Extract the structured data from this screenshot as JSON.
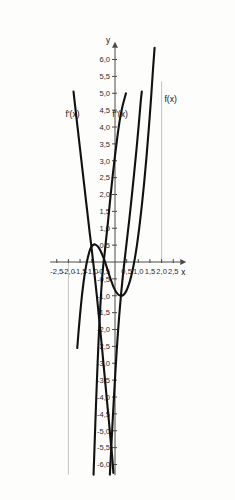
{
  "chart_data": {
    "type": "line",
    "title": "",
    "subtitle": "",
    "xlabel": "x",
    "ylabel": "y",
    "xlim": [
      -2.75,
      2.75
    ],
    "ylim": [
      -6.3,
      6.4
    ],
    "grid": true,
    "grid_description": "light gray vertical gridlines at x = -2,0 (below axis) and x = 2,0 (above axis)",
    "decimal_separator": ",",
    "legend_position": "inline curve labels",
    "x_ticks": [
      -2.5,
      -2.0,
      -1.5,
      -1.0,
      -0.5,
      0.5,
      1.0,
      1.5,
      2.0,
      2.5
    ],
    "x_tick_labels": [
      "-2,5",
      "-2,0",
      "-1,5",
      "-1,0",
      "-0,5",
      "0,5",
      "1,0",
      "1,5",
      "2,0",
      "2,5"
    ],
    "y_ticks": [
      -6.0,
      -5.5,
      -5.0,
      -4.5,
      -4.0,
      -3.5,
      -3.0,
      -2.5,
      -2.0,
      -1.5,
      -1.0,
      -0.5,
      0.5,
      1.0,
      1.5,
      2.0,
      2.5,
      3.0,
      3.5,
      4.0,
      4.5,
      5.0,
      5.5,
      6.0
    ],
    "y_tick_labels": [
      "-6,0",
      "-5,5",
      "-5,0",
      "-4,5",
      "-4,0",
      "-3,5",
      "-3,0",
      "-2,5",
      "-2,0",
      "-1,5",
      "-1,0",
      "-0,5",
      "0,5",
      "1,0",
      "1,5",
      "2,0",
      "2,5",
      "3,0",
      "3,5",
      "4,0",
      "4,5",
      "5,0",
      "5,5",
      "6,0"
    ],
    "series": [
      {
        "name": "f(x)",
        "label": "f(x)",
        "label_x": 2.12,
        "label_y": 4.75,
        "description": "cubic curve with local maximum near (-1, 0,5) and local minimum near (0,3, -1), rising steeply to the right",
        "points": [
          [
            -1.62,
            -2.55
          ],
          [
            -1.55,
            -1.95
          ],
          [
            -1.45,
            -1.2
          ],
          [
            -1.35,
            -0.6
          ],
          [
            -1.25,
            -0.15
          ],
          [
            -1.15,
            0.18
          ],
          [
            -1.05,
            0.4
          ],
          [
            -0.95,
            0.5
          ],
          [
            -0.85,
            0.52
          ],
          [
            -0.75,
            0.47
          ],
          [
            -0.65,
            0.37
          ],
          [
            -0.55,
            0.22
          ],
          [
            -0.45,
            0.05
          ],
          [
            -0.35,
            -0.16
          ],
          [
            -0.25,
            -0.38
          ],
          [
            -0.15,
            -0.58
          ],
          [
            -0.05,
            -0.76
          ],
          [
            0.05,
            -0.89
          ],
          [
            0.15,
            -0.97
          ],
          [
            0.25,
            -1.0
          ],
          [
            0.35,
            -0.98
          ],
          [
            0.45,
            -0.9
          ],
          [
            0.55,
            -0.75
          ],
          [
            0.65,
            -0.54
          ],
          [
            0.75,
            -0.26
          ],
          [
            0.85,
            0.1
          ],
          [
            0.95,
            0.54
          ],
          [
            1.05,
            1.06
          ],
          [
            1.15,
            1.66
          ],
          [
            1.25,
            2.34
          ],
          [
            1.35,
            3.1
          ],
          [
            1.45,
            3.95
          ],
          [
            1.55,
            4.88
          ],
          [
            1.63,
            5.7
          ],
          [
            1.7,
            6.35
          ]
        ]
      },
      {
        "name": "f''(x)",
        "label": "f''(x)",
        "label_x": -0.12,
        "label_y": 4.3,
        "description": "steeply rising curve crossing the x-axis near x = -0,45, reaching about 5,0 near x = 0,5",
        "points": [
          [
            -0.92,
            -6.3
          ],
          [
            -0.88,
            -5.5
          ],
          [
            -0.84,
            -4.7
          ],
          [
            -0.8,
            -3.95
          ],
          [
            -0.75,
            -3.05
          ],
          [
            -0.7,
            -2.25
          ],
          [
            -0.65,
            -1.55
          ],
          [
            -0.6,
            -0.95
          ],
          [
            -0.55,
            -0.45
          ],
          [
            -0.5,
            -0.08
          ],
          [
            -0.45,
            0.22
          ],
          [
            -0.4,
            0.55
          ],
          [
            -0.3,
            1.2
          ],
          [
            -0.2,
            1.9
          ],
          [
            -0.1,
            2.55
          ],
          [
            0.0,
            3.15
          ],
          [
            0.1,
            3.7
          ],
          [
            0.2,
            4.18
          ],
          [
            0.3,
            4.55
          ],
          [
            0.4,
            4.82
          ],
          [
            0.47,
            5.0
          ]
        ]
      },
      {
        "name": "f'(x)",
        "label": "f'(x)",
        "label_x": -2.12,
        "label_y": 4.3,
        "description": "steep descending straight-like curve crossing the x-axis near x = -1,0 and again near x = 0,9 region; plotted from upper-left to lower-right",
        "points": [
          [
            -1.78,
            5.05
          ],
          [
            -1.7,
            4.55
          ],
          [
            -1.6,
            3.95
          ],
          [
            -1.5,
            3.35
          ],
          [
            -1.4,
            2.75
          ],
          [
            -1.3,
            2.15
          ],
          [
            -1.2,
            1.55
          ],
          [
            -1.1,
            0.95
          ],
          [
            -1.0,
            0.38
          ],
          [
            -0.92,
            -0.1
          ],
          [
            -0.85,
            -0.55
          ],
          [
            -0.78,
            -1.0
          ],
          [
            -0.7,
            -1.55
          ],
          [
            -0.62,
            -2.1
          ],
          [
            -0.55,
            -2.6
          ],
          [
            -0.48,
            -3.12
          ],
          [
            -0.4,
            -3.7
          ],
          [
            -0.33,
            -4.22
          ],
          [
            -0.26,
            -4.72
          ],
          [
            -0.2,
            -5.2
          ],
          [
            -0.14,
            -5.62
          ],
          [
            -0.1,
            -5.95
          ],
          [
            -0.07,
            -6.25
          ]
        ]
      },
      {
        "name": "f-unlabeled-right",
        "label": "",
        "label_x": null,
        "label_y": null,
        "description": "additional rising curve between f''(x) and f(x), reaching about 5,0 near x = 1,1",
        "points": [
          [
            -0.22,
            -6.3
          ],
          [
            -0.16,
            -5.5
          ],
          [
            -0.1,
            -4.7
          ],
          [
            -0.04,
            -3.95
          ],
          [
            0.03,
            -3.1
          ],
          [
            0.1,
            -2.35
          ],
          [
            0.18,
            -1.6
          ],
          [
            0.26,
            -0.95
          ],
          [
            0.34,
            -0.4
          ],
          [
            0.42,
            0.1
          ],
          [
            0.52,
            0.7
          ],
          [
            0.62,
            1.3
          ],
          [
            0.72,
            1.95
          ],
          [
            0.82,
            2.62
          ],
          [
            0.92,
            3.32
          ],
          [
            1.02,
            4.08
          ],
          [
            1.1,
            4.72
          ],
          [
            1.15,
            5.05
          ]
        ]
      }
    ],
    "vertical_gridlines": [
      {
        "x": -2.0,
        "y_from": 0.0,
        "y_to": -6.3
      },
      {
        "x": 2.0,
        "y_from": 5.35,
        "y_to": 0.0
      }
    ]
  }
}
